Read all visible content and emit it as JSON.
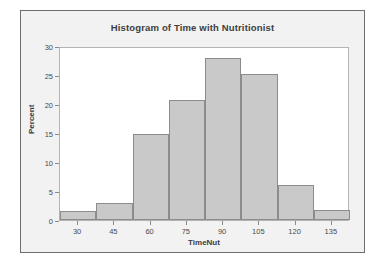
{
  "figure": {
    "background_color": "#f2f2f2",
    "border_color": "#6e6e6e",
    "plot_background_color": "#ffffff",
    "plot_border_color": "#b4b4b4"
  },
  "chart_data": {
    "type": "bar",
    "title": "Histogram of Time with Nutritionist",
    "xlabel": "TimeNut",
    "ylabel": "Percent",
    "categories": [
      "30",
      "45",
      "60",
      "75",
      "90",
      "105",
      "120",
      "135"
    ],
    "bin_centers": [
      30,
      45,
      60,
      75,
      90,
      105,
      120,
      135
    ],
    "bin_width": 15,
    "bin_edges": [
      22.5,
      37.5,
      52.5,
      67.5,
      82.5,
      97.5,
      112.5,
      127.5,
      142.5
    ],
    "values": [
      1.5,
      3.0,
      14.8,
      20.7,
      28.0,
      25.1,
      6.1,
      1.8
    ],
    "xlim": [
      22.5,
      142.5
    ],
    "ylim": [
      0,
      30
    ],
    "xticks": [
      30,
      45,
      60,
      75,
      90,
      105,
      120,
      135
    ],
    "xtick_labels": [
      "30",
      "45",
      "60",
      "75",
      "90",
      "105",
      "120",
      "135"
    ],
    "yticks": [
      0,
      5,
      10,
      15,
      20,
      25,
      30
    ],
    "ytick_labels": [
      "0",
      "5",
      "10",
      "15",
      "20",
      "25",
      "30"
    ],
    "grid": false,
    "legend": null,
    "bar_fill_color": "#c9c9c9",
    "bar_edge_color": "#8c8c8c"
  }
}
